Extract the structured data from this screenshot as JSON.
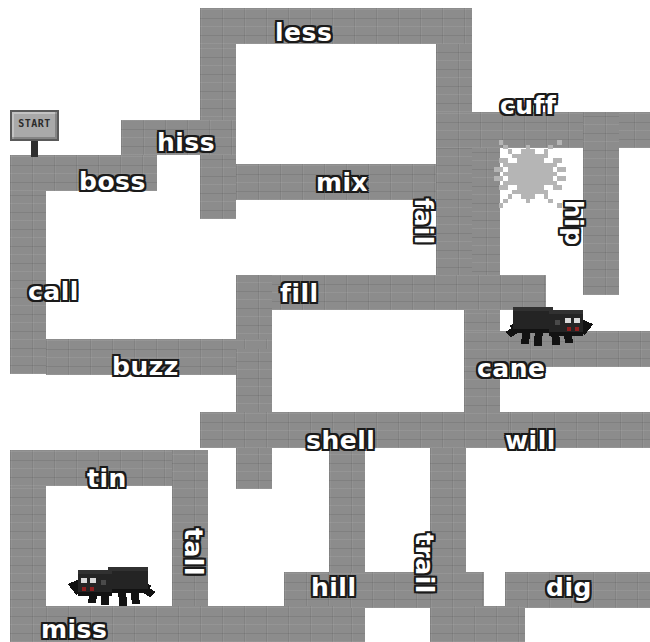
{
  "canvas": {
    "width": 650,
    "height": 642,
    "background": "#ffffff"
  },
  "theme": {
    "wall_color": "#8c8c8c",
    "path_color": "#ffffff",
    "word_fill": "#ffffff",
    "word_outline": "#1a1a1a",
    "spider_color": "#1b1b1b",
    "cobweb_color": "#b5b5b5"
  },
  "start_marker": {
    "label": "START",
    "x": 10,
    "y": 110
  },
  "words": [
    {
      "id": "less",
      "label": "less",
      "x": 275,
      "y": 20,
      "orientation": "horizontal"
    },
    {
      "id": "cuff",
      "label": "cuff",
      "x": 500,
      "y": 93,
      "orientation": "horizontal"
    },
    {
      "id": "hiss",
      "label": "hiss",
      "x": 157,
      "y": 130,
      "orientation": "horizontal"
    },
    {
      "id": "boss",
      "label": "boss",
      "x": 79,
      "y": 169,
      "orientation": "horizontal"
    },
    {
      "id": "mix",
      "label": "mix",
      "x": 316,
      "y": 170,
      "orientation": "horizontal"
    },
    {
      "id": "fail",
      "label": "fail",
      "x": 436,
      "y": 198,
      "orientation": "vertical"
    },
    {
      "id": "hip",
      "label": "hip",
      "x": 586,
      "y": 200,
      "orientation": "vertical"
    },
    {
      "id": "call",
      "label": "call",
      "x": 28,
      "y": 279,
      "orientation": "horizontal"
    },
    {
      "id": "fill",
      "label": "fill",
      "x": 280,
      "y": 281,
      "orientation": "horizontal"
    },
    {
      "id": "buzz",
      "label": "buzz",
      "x": 112,
      "y": 354,
      "orientation": "horizontal"
    },
    {
      "id": "cane",
      "label": "cane",
      "x": 477,
      "y": 356,
      "orientation": "horizontal"
    },
    {
      "id": "shell",
      "label": "shell",
      "x": 306,
      "y": 428,
      "orientation": "horizontal"
    },
    {
      "id": "will",
      "label": "will",
      "x": 505,
      "y": 428,
      "orientation": "horizontal"
    },
    {
      "id": "tin",
      "label": "tin",
      "x": 87,
      "y": 466,
      "orientation": "horizontal"
    },
    {
      "id": "tall",
      "label": "tall",
      "x": 206,
      "y": 528,
      "orientation": "vertical"
    },
    {
      "id": "trail",
      "label": "trail",
      "x": 437,
      "y": 533,
      "orientation": "vertical"
    },
    {
      "id": "hill",
      "label": "hill",
      "x": 311,
      "y": 575,
      "orientation": "horizontal"
    },
    {
      "id": "dig",
      "label": "dig",
      "x": 546,
      "y": 575,
      "orientation": "horizontal"
    },
    {
      "id": "miss",
      "label": "miss",
      "x": 41,
      "y": 617,
      "orientation": "horizontal"
    }
  ],
  "walls": [
    {
      "x": 200,
      "y": 8,
      "w": 272,
      "h": 36
    },
    {
      "x": 200,
      "y": 44,
      "w": 36,
      "h": 175
    },
    {
      "x": 436,
      "y": 44,
      "w": 36,
      "h": 68
    },
    {
      "x": 121,
      "y": 120,
      "w": 115,
      "h": 35
    },
    {
      "x": 10,
      "y": 155,
      "w": 147,
      "h": 36
    },
    {
      "x": 10,
      "y": 191,
      "w": 36,
      "h": 183
    },
    {
      "x": 436,
      "y": 112,
      "w": 214,
      "h": 36
    },
    {
      "x": 464,
      "y": 148,
      "w": 36,
      "h": 183
    },
    {
      "x": 583,
      "y": 112,
      "w": 36,
      "h": 183
    },
    {
      "x": 236,
      "y": 164,
      "w": 236,
      "h": 36
    },
    {
      "x": 436,
      "y": 148,
      "w": 36,
      "h": 145
    },
    {
      "x": 236,
      "y": 275,
      "w": 310,
      "h": 35
    },
    {
      "x": 236,
      "y": 275,
      "w": 36,
      "h": 110
    },
    {
      "x": 46,
      "y": 339,
      "w": 226,
      "h": 36
    },
    {
      "x": 464,
      "y": 331,
      "w": 186,
      "h": 36
    },
    {
      "x": 236,
      "y": 349,
      "w": 36,
      "h": 140
    },
    {
      "x": 10,
      "y": 450,
      "w": 36,
      "h": 192
    },
    {
      "x": 10,
      "y": 450,
      "w": 198,
      "h": 36
    },
    {
      "x": 172,
      "y": 450,
      "w": 36,
      "h": 192
    },
    {
      "x": 200,
      "y": 412,
      "w": 346,
      "h": 36
    },
    {
      "x": 464,
      "y": 367,
      "w": 36,
      "h": 81
    },
    {
      "x": 510,
      "y": 412,
      "w": 140,
      "h": 36
    },
    {
      "x": 329,
      "y": 448,
      "w": 36,
      "h": 194
    },
    {
      "x": 284,
      "y": 572,
      "w": 200,
      "h": 36
    },
    {
      "x": 430,
      "y": 448,
      "w": 36,
      "h": 160
    },
    {
      "x": 505,
      "y": 572,
      "w": 145,
      "h": 36
    },
    {
      "x": 46,
      "y": 606,
      "w": 290,
      "h": 36
    },
    {
      "x": 430,
      "y": 606,
      "w": 95,
      "h": 36
    }
  ],
  "sprites": [
    {
      "id": "spider-cane",
      "type": "spider",
      "x": 489,
      "y": 296,
      "w": 110,
      "h": 56,
      "flipped": false
    },
    {
      "id": "spider-miss",
      "type": "spider",
      "x": 62,
      "y": 556,
      "w": 110,
      "h": 56,
      "flipped": true
    },
    {
      "id": "cobweb-cuff",
      "type": "cobweb",
      "x": 494,
      "y": 140,
      "w": 72,
      "h": 72
    }
  ]
}
